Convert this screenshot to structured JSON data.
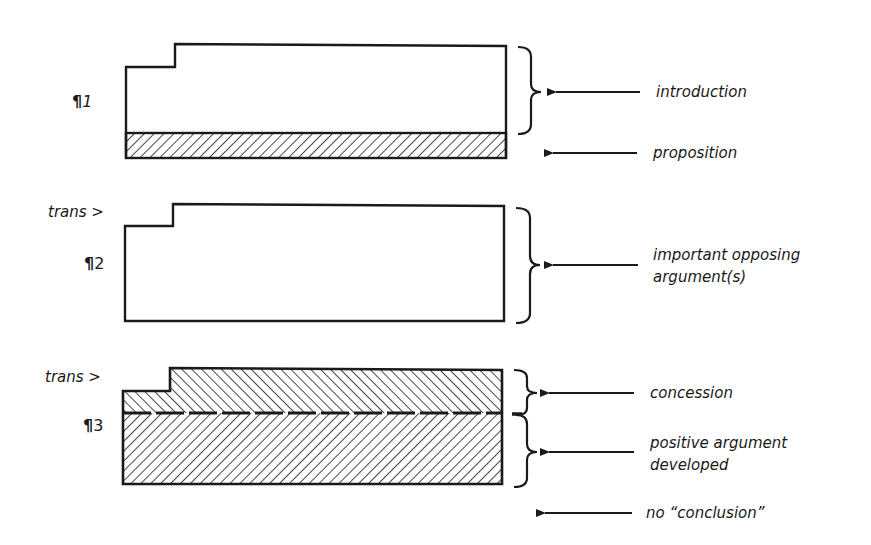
{
  "diagram": {
    "type": "essay-structure",
    "colors": {
      "ink": "#1a1a1a",
      "background": "#ffffff"
    },
    "paragraphs": [
      {
        "id": "p1",
        "mark": "¶",
        "number": "1",
        "has_transition": false,
        "sections": [
          {
            "name": "introduction",
            "fill": "none"
          },
          {
            "name": "proposition",
            "fill": "hatch-forward"
          }
        ]
      },
      {
        "id": "p2",
        "mark": "¶",
        "number": "2",
        "has_transition": true,
        "sections": [
          {
            "name": "important opposing argument(s)",
            "fill": "none"
          }
        ]
      },
      {
        "id": "p3",
        "mark": "¶",
        "number": "3",
        "has_transition": true,
        "sections": [
          {
            "name": "concession",
            "fill": "hatch-back"
          },
          {
            "name": "positive argument developed",
            "fill": "hatch-forward"
          }
        ]
      }
    ],
    "transition_label": "trans >",
    "annotations": {
      "introduction": "introduction",
      "proposition": "proposition",
      "opposing_line1": "important opposing",
      "opposing_line2": "argument(s)",
      "concession": "concession",
      "positive_line1": "positive argument",
      "positive_line2": "developed",
      "no_conclusion": "no “conclusion”"
    }
  }
}
